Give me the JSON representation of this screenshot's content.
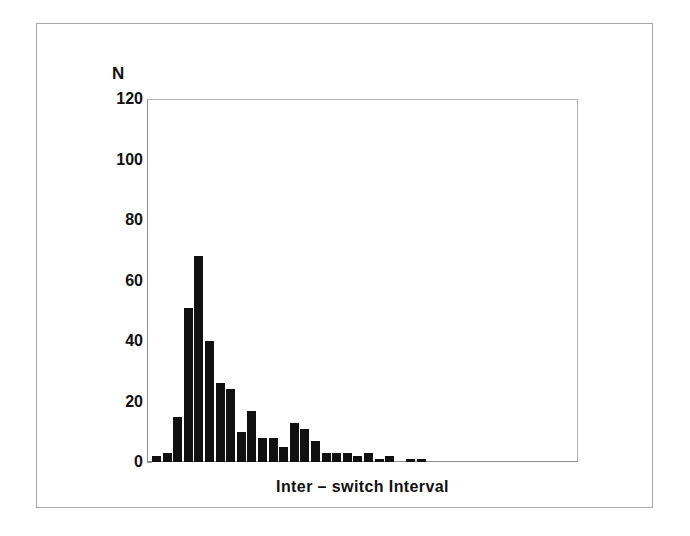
{
  "figure": {
    "y_axis_title": "N",
    "x_axis_title": "Inter – switch Interval",
    "frame_color": "#a8a8a8",
    "bar_color": "#111111",
    "axis_color": "#8e8e8e"
  },
  "chart_data": {
    "type": "bar",
    "title": "",
    "subtitle": "",
    "xlabel": "Inter – switch Interval",
    "ylabel": "N",
    "ylim": [
      0,
      120
    ],
    "yticks": [
      0,
      20,
      40,
      60,
      80,
      100,
      120
    ],
    "ytick_labels": [
      "0",
      "20",
      "40",
      "60",
      "80",
      "100",
      "120"
    ],
    "xticks": [],
    "xtick_labels": [],
    "grid": false,
    "legend": null,
    "bin_width_px": 9,
    "bin_step_px": 10.6,
    "first_bin_left_px": 5,
    "categories": [
      "1",
      "2",
      "3",
      "4",
      "5",
      "6",
      "7",
      "8",
      "9",
      "10",
      "11",
      "12",
      "13",
      "14",
      "15",
      "16",
      "17",
      "18",
      "19",
      "20",
      "21",
      "22",
      "23",
      "24",
      "25",
      "26",
      "27",
      "28",
      "29",
      "30",
      "31",
      "32",
      "33",
      "34",
      "35",
      "36",
      "37",
      "38"
    ],
    "values": [
      2,
      3,
      15,
      51,
      68,
      40,
      26,
      24,
      10,
      17,
      8,
      8,
      5,
      13,
      11,
      7,
      3,
      3,
      3,
      2,
      3,
      1,
      2,
      0,
      1,
      1,
      0,
      0,
      0,
      0,
      0,
      0,
      0,
      0,
      0,
      0,
      0,
      0
    ],
    "series": [
      {
        "name": "Inter-switch interval counts",
        "values": [
          2,
          3,
          15,
          51,
          68,
          40,
          26,
          24,
          10,
          17,
          8,
          8,
          5,
          13,
          11,
          7,
          3,
          3,
          3,
          2,
          3,
          1,
          2,
          0,
          1,
          1,
          0,
          0,
          0,
          0,
          0,
          0,
          0,
          0,
          0,
          0,
          0,
          0
        ]
      }
    ]
  }
}
